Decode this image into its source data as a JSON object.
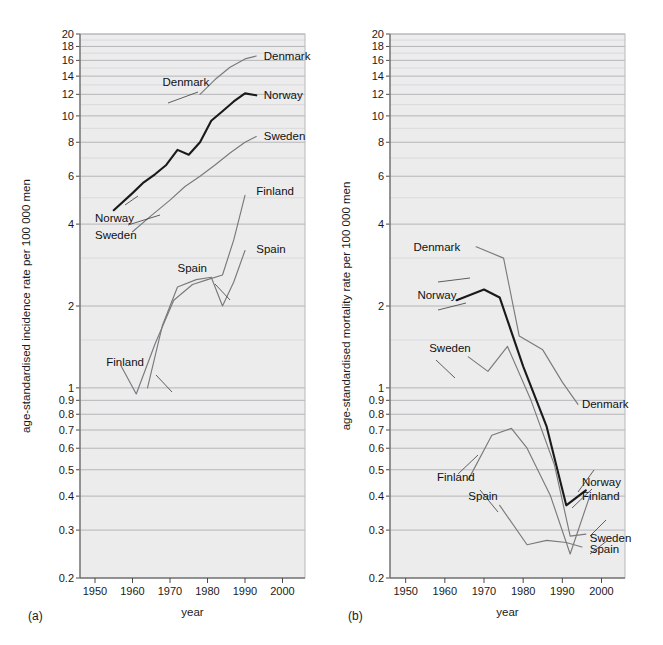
{
  "figure": {
    "panels": [
      {
        "id": "a",
        "panel_label": "(a)",
        "ylabel": "age-standardised incidence rate per 100 000 men",
        "xlabel": "year"
      },
      {
        "id": "b",
        "panel_label": "(b)",
        "ylabel": "age-standardised mortality rate per 100 000 men",
        "xlabel": "year"
      }
    ],
    "x_ticks": [
      "1950",
      "1960",
      "1970",
      "1980",
      "1990",
      "2000"
    ],
    "y_ticks": [
      "20",
      "18",
      "16",
      "14",
      "12",
      "10",
      "8",
      "6",
      "4",
      "2",
      "1",
      "0.9",
      "0.8",
      "0.7",
      "0.6",
      "0.5",
      "0.4",
      "0.3",
      "0.2"
    ],
    "colors": {
      "plot_background": "#ececed",
      "gridline": "#b0b0b3",
      "dark_series": "#1a1a1a",
      "grey_series": "#7a7a7c",
      "text": "#1a1a1a"
    }
  },
  "chart_data": [
    {
      "type": "line",
      "id": "a",
      "title": "(a)",
      "xlabel": "year",
      "ylabel": "age-standardised incidence rate per 100 000 men",
      "xlim": [
        1946,
        2006
      ],
      "ylim": [
        0.2,
        20
      ],
      "yscale": "log",
      "grid": true,
      "legend": "inline-annotations",
      "xticks": [
        1950,
        1960,
        1970,
        1980,
        1990,
        2000
      ],
      "yticks": [
        0.2,
        0.3,
        0.4,
        0.5,
        0.6,
        0.7,
        0.8,
        0.9,
        1,
        2,
        4,
        6,
        8,
        10,
        12,
        14,
        16,
        18,
        20
      ],
      "series": [
        {
          "name": "Denmark",
          "color": "#7a7a7c",
          "label_left": {
            "text": "Denmark",
            "x": 1968,
            "y": 13.3
          },
          "label_right": {
            "text": "Denmark",
            "x": 1995,
            "y": 16.6
          },
          "x": [
            1978,
            1982,
            1986,
            1990,
            1993
          ],
          "y": [
            12.0,
            13.6,
            15.1,
            16.2,
            16.6
          ]
        },
        {
          "name": "Norway",
          "color": "#1a1a1a",
          "label_left": {
            "text": "Norway",
            "x": 1950,
            "y": 4.2
          },
          "label_right": {
            "text": "Norway",
            "x": 1995,
            "y": 11.9
          },
          "x": [
            1955,
            1960,
            1963,
            1966,
            1969,
            1972,
            1975,
            1978,
            1981,
            1984,
            1987,
            1990,
            1993
          ],
          "y": [
            4.5,
            5.2,
            5.7,
            6.1,
            6.6,
            7.5,
            7.2,
            8.0,
            9.6,
            10.4,
            11.3,
            12.1,
            11.9
          ]
        },
        {
          "name": "Sweden",
          "color": "#7a7a7c",
          "label_left": {
            "text": "Sweden",
            "x": 1950,
            "y": 3.65
          },
          "label_right": {
            "text": "Sweden",
            "x": 1995,
            "y": 8.4
          },
          "x": [
            1960,
            1965,
            1970,
            1974,
            1978,
            1982,
            1986,
            1990,
            1993
          ],
          "y": [
            3.75,
            4.3,
            4.9,
            5.5,
            6.0,
            6.6,
            7.3,
            8.0,
            8.4
          ]
        },
        {
          "name": "Finland",
          "color": "#7a7a7c",
          "label_left": {
            "text": "Finland",
            "x": 1953,
            "y": 1.25
          },
          "label_right": {
            "text": "Finland",
            "x": 1993,
            "y": 5.3
          },
          "x": [
            1957,
            1961,
            1966,
            1971,
            1976,
            1980,
            1984,
            1987,
            1990
          ],
          "y": [
            1.2,
            0.95,
            1.45,
            2.1,
            2.4,
            2.5,
            2.6,
            3.5,
            5.1
          ]
        },
        {
          "name": "Spain",
          "color": "#7a7a7c",
          "label_left": {
            "text": "Spain",
            "x": 1972,
            "y": 2.75
          },
          "label_right": {
            "text": "Spain",
            "x": 1993,
            "y": 3.25
          },
          "x": [
            1964,
            1968,
            1972,
            1977,
            1981,
            1984,
            1987,
            1990
          ],
          "y": [
            1.0,
            1.7,
            2.35,
            2.5,
            2.55,
            2.0,
            2.45,
            3.2
          ]
        }
      ]
    },
    {
      "type": "line",
      "id": "b",
      "title": "(b)",
      "xlabel": "year",
      "ylabel": "age-standardised mortality rate per 100 000 men",
      "xlim": [
        1946,
        2006
      ],
      "ylim": [
        0.2,
        20
      ],
      "yscale": "log",
      "grid": true,
      "legend": "inline-annotations",
      "xticks": [
        1950,
        1960,
        1970,
        1980,
        1990,
        2000
      ],
      "yticks": [
        0.2,
        0.3,
        0.4,
        0.5,
        0.6,
        0.7,
        0.8,
        0.9,
        1,
        2,
        4,
        6,
        8,
        10,
        12,
        14,
        16,
        18,
        20
      ],
      "series": [
        {
          "name": "Denmark",
          "color": "#7a7a7c",
          "label_left": {
            "text": "Denmark",
            "x": 1952,
            "y": 3.3
          },
          "label_right": {
            "text": "Denmark",
            "x": 1995,
            "y": 0.87
          },
          "x": [
            1968,
            1975,
            1979,
            1985,
            1990,
            1994
          ],
          "y": [
            3.3,
            3.0,
            1.55,
            1.38,
            1.05,
            0.87
          ]
        },
        {
          "name": "Norway",
          "color": "#1a1a1a",
          "label_left": {
            "text": "Norway",
            "x": 1953,
            "y": 2.2
          },
          "label_right": {
            "text": "Norway",
            "x": 1995,
            "y": 0.45
          },
          "x": [
            1963,
            1970,
            1974,
            1980,
            1986,
            1991,
            1996
          ],
          "y": [
            2.1,
            2.3,
            2.15,
            1.2,
            0.72,
            0.37,
            0.42
          ]
        },
        {
          "name": "Sweden",
          "color": "#7a7a7c",
          "label_left": {
            "text": "Sweden",
            "x": 1956,
            "y": 1.4
          },
          "label_right": {
            "text": "Sweden",
            "x": 1997,
            "y": 0.28
          },
          "x": [
            1966,
            1971,
            1976,
            1982,
            1988,
            1992,
            1996
          ],
          "y": [
            1.3,
            1.15,
            1.42,
            0.9,
            0.52,
            0.285,
            0.29
          ]
        },
        {
          "name": "Finland",
          "color": "#7a7a7c",
          "label_left": {
            "text": "Finland",
            "x": 1958,
            "y": 0.47
          },
          "label_right": {
            "text": "Finland",
            "x": 1995,
            "y": 0.4
          },
          "x": [
            1966,
            1972,
            1977,
            1981,
            1987,
            1992,
            1997
          ],
          "y": [
            0.46,
            0.67,
            0.71,
            0.6,
            0.4,
            0.245,
            0.4
          ]
        },
        {
          "name": "Spain",
          "color": "#7a7a7c",
          "label_left": {
            "text": "Spain",
            "x": 1966,
            "y": 0.4
          },
          "label_right": {
            "text": "Spain",
            "x": 1997,
            "y": 0.255
          },
          "x": [
            1974,
            1981,
            1986,
            1991,
            1995
          ],
          "y": [
            0.37,
            0.265,
            0.275,
            0.27,
            0.26
          ]
        }
      ]
    }
  ]
}
